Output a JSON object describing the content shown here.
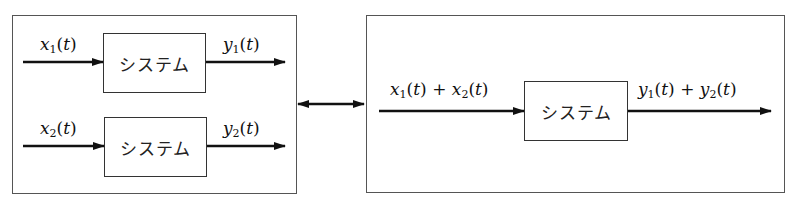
{
  "diagram": {
    "type": "block-diagram",
    "left_panel": {
      "systems": [
        {
          "label": "システム",
          "input": {
            "var": "x",
            "sub": "1",
            "arg": "t"
          },
          "output": {
            "var": "y",
            "sub": "1",
            "arg": "t"
          }
        },
        {
          "label": "システム",
          "input": {
            "var": "x",
            "sub": "2",
            "arg": "t"
          },
          "output": {
            "var": "y",
            "sub": "2",
            "arg": "t"
          }
        }
      ]
    },
    "connector": {
      "type": "double-arrow"
    },
    "right_panel": {
      "system": {
        "label": "システム"
      },
      "input": {
        "a_var": "x",
        "a_sub": "1",
        "b_var": "x",
        "b_sub": "2",
        "arg": "t",
        "op": "+"
      },
      "output": {
        "a_var": "y",
        "a_sub": "1",
        "b_var": "y",
        "b_sub": "2",
        "arg": "t",
        "op": "+"
      }
    },
    "colors": {
      "line": "#111111",
      "frame": "#555555",
      "background": "#ffffff"
    }
  }
}
